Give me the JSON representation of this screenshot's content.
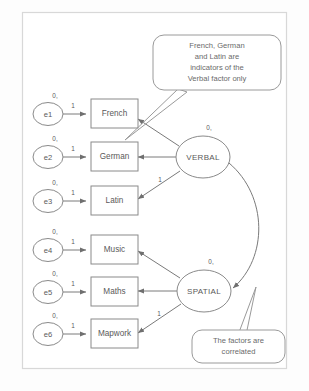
{
  "diagram": {
    "type": "sem-path-diagram",
    "colors": {
      "background": "#fdfdfd",
      "frame_stroke": "#d8d8d8",
      "node_stroke": "#8a8a8a",
      "path_stroke": "#7a7a7a",
      "text": "#5a5a5a",
      "callout_text": "#6a6a6a"
    },
    "error_terms": [
      {
        "id": "e1",
        "label": "e1",
        "mean_label": "0,",
        "loading_label": "1"
      },
      {
        "id": "e2",
        "label": "e2",
        "mean_label": "0,",
        "loading_label": "1"
      },
      {
        "id": "e3",
        "label": "e3",
        "mean_label": "0,",
        "loading_label": "1"
      },
      {
        "id": "e4",
        "label": "e4",
        "mean_label": "0,",
        "loading_label": "1"
      },
      {
        "id": "e5",
        "label": "e5",
        "mean_label": "0,",
        "loading_label": "1"
      },
      {
        "id": "e6",
        "label": "e6",
        "mean_label": "0,",
        "loading_label": "1"
      }
    ],
    "observed_variables": [
      {
        "id": "french",
        "label": "French"
      },
      {
        "id": "german",
        "label": "German"
      },
      {
        "id": "latin",
        "label": "Latin"
      },
      {
        "id": "music",
        "label": "Music"
      },
      {
        "id": "maths",
        "label": "Maths"
      },
      {
        "id": "mapwork",
        "label": "Mapwork"
      }
    ],
    "latent_factors": [
      {
        "id": "verbal",
        "label": "VERBAL",
        "mean_label": "0,"
      },
      {
        "id": "spatial",
        "label": "SPATIAL",
        "mean_label": "0,"
      }
    ],
    "factor_loadings": [
      {
        "from": "verbal",
        "to": "french",
        "label": ""
      },
      {
        "from": "verbal",
        "to": "german",
        "label": ""
      },
      {
        "from": "verbal",
        "to": "latin",
        "label": "1"
      },
      {
        "from": "spatial",
        "to": "music",
        "label": ""
      },
      {
        "from": "spatial",
        "to": "maths",
        "label": ""
      },
      {
        "from": "spatial",
        "to": "mapwork",
        "label": "1"
      }
    ],
    "covariance": {
      "from": "verbal",
      "to": "spatial",
      "label": ""
    },
    "callouts": [
      {
        "id": "verbal-indicators-note",
        "lines": [
          "French, German",
          "and Latin are",
          "indicators of the",
          "Verbal factor only"
        ]
      },
      {
        "id": "factors-correlated-note",
        "lines": [
          "The factors are",
          "correlated"
        ]
      }
    ]
  }
}
